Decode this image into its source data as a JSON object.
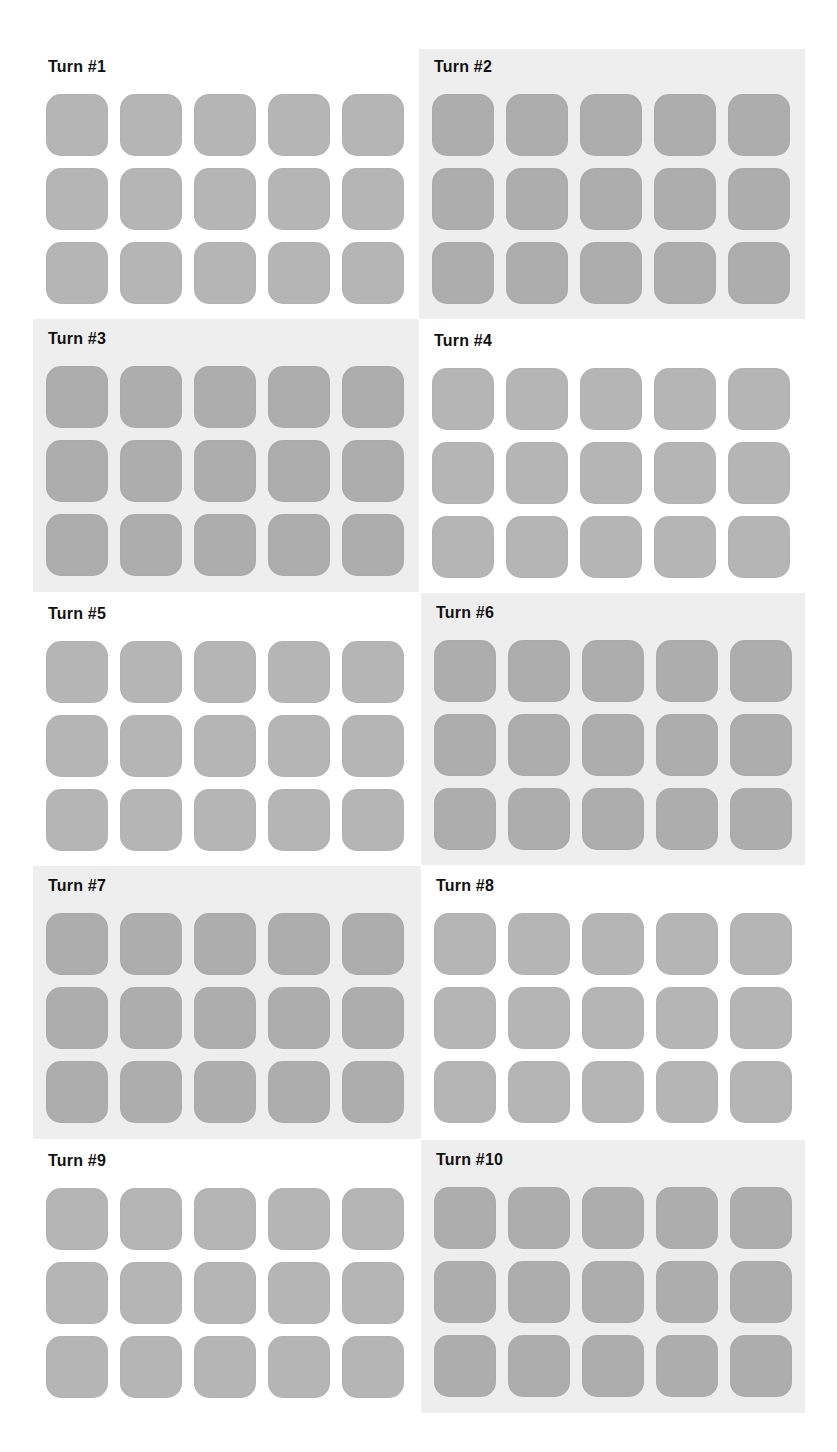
{
  "page": {
    "layout": {
      "columns": 2,
      "rows": 5,
      "tiles_per_panel": {
        "rows": 3,
        "cols": 5
      }
    },
    "colors": {
      "page_bg": "#ffffff",
      "shaded_panel_bg": "#eeeeee",
      "tile": "#b5b5b5",
      "tile_on_shaded": "#adadad",
      "title_text": "#111111"
    }
  },
  "panels": [
    {
      "title": "Turn #1",
      "shaded": false
    },
    {
      "title": "Turn #2",
      "shaded": true
    },
    {
      "title": "Turn #3",
      "shaded": true
    },
    {
      "title": "Turn #4",
      "shaded": false
    },
    {
      "title": "Turn #5",
      "shaded": false
    },
    {
      "title": "Turn #6",
      "shaded": true
    },
    {
      "title": "Turn #7",
      "shaded": true
    },
    {
      "title": "Turn #8",
      "shaded": false
    },
    {
      "title": "Turn #9",
      "shaded": false
    },
    {
      "title": "Turn #10",
      "shaded": true
    }
  ]
}
